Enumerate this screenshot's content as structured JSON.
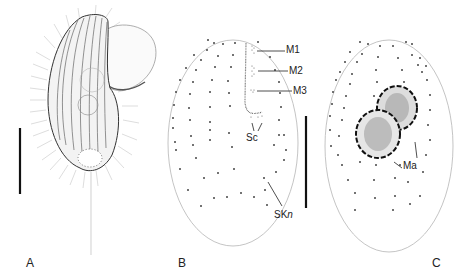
{
  "figure": {
    "panels": [
      {
        "id": "A",
        "label": "A",
        "description": "Living cell, lateral view with cilia and caudal cilium",
        "scale_bar": true
      },
      {
        "id": "B",
        "label": "B",
        "description": "Ciliary pattern, ventral side",
        "scale_bar": true,
        "annotations": [
          "M1",
          "M2",
          "M3",
          "Sc",
          "SKn"
        ]
      },
      {
        "id": "C",
        "label": "C",
        "description": "Ciliary pattern, dorsal side with macronucleus",
        "annotations": [
          "Ma"
        ]
      }
    ],
    "annotations": {
      "m1": "M1",
      "m2": "M2",
      "m3": "M3",
      "sc": "Sc",
      "skn_prefix": "SK",
      "skn_suffix": "n",
      "ma": "Ma"
    },
    "labels": {
      "a": "A",
      "b": "B",
      "c": "C"
    }
  }
}
